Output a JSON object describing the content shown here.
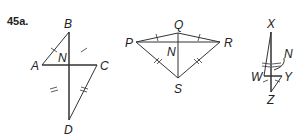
{
  "problem_number": "45a.",
  "figures": [
    {
      "name": "kite-ABCD",
      "labels": {
        "B": "B",
        "A": "A",
        "C": "C",
        "D": "D",
        "N": "N"
      }
    },
    {
      "name": "kite-PQRS",
      "labels": {
        "P": "P",
        "Q": "Q",
        "R": "R",
        "S": "S",
        "N": "N"
      }
    },
    {
      "name": "kite-XWZY",
      "labels": {
        "X": "X",
        "W": "W",
        "Y": "Y",
        "Z": "Z",
        "N": "N"
      }
    }
  ],
  "colors": {
    "line": "#333333",
    "text": "#222222",
    "background": "#ffffff"
  }
}
